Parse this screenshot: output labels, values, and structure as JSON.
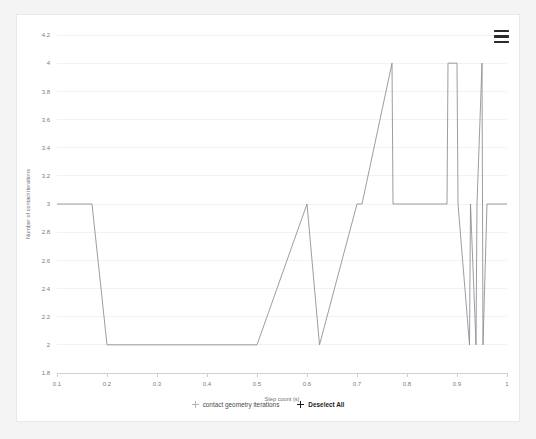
{
  "card": {
    "background": "#ffffff",
    "border_color": "#e9e9e9"
  },
  "menu": {
    "icon": "hamburger-menu-icon",
    "label": "Chart context menu"
  },
  "legend": {
    "entries": [
      {
        "label": "contact geometry iterations",
        "marker": "plus-marker",
        "color": "#b2b2b8",
        "state": "inactive"
      },
      {
        "label": "Deselect All",
        "marker": "plus-marker",
        "color": "#1b1b1b",
        "state": "active"
      }
    ]
  },
  "chart_data": {
    "type": "line",
    "title": "",
    "subtitle": "",
    "xlabel": "Step count (s)",
    "ylabel": "Number of contact iterations",
    "xlim": [
      0.1,
      1.0
    ],
    "ylim": [
      1.8,
      4.2
    ],
    "grid": true,
    "legend_position": "bottom",
    "line_color": "#8a8a92",
    "xticks": [
      "0.1",
      "0.2",
      "0.3",
      "0.4",
      "0.5",
      "0.6",
      "0.7",
      "0.8",
      "0.9",
      "1"
    ],
    "xtick_values": [
      0.1,
      0.2,
      0.3,
      0.4,
      0.5,
      0.6,
      0.7,
      0.8,
      0.9,
      1.0
    ],
    "yticks": [
      "1.8",
      "2",
      "2.2",
      "2.4",
      "2.6",
      "2.8",
      "3",
      "3.2",
      "3.4",
      "3.6",
      "3.8",
      "4",
      "4.2"
    ],
    "ytick_values": [
      1.8,
      2.0,
      2.2,
      2.4,
      2.6,
      2.8,
      3.0,
      3.2,
      3.4,
      3.6,
      3.8,
      4.0,
      4.2
    ],
    "series": [
      {
        "name": "contact geometry iterations",
        "x": [
          0.1,
          0.17,
          0.2,
          0.5,
          0.6,
          0.625,
          0.7,
          0.71,
          0.77,
          0.772,
          0.88,
          0.882,
          0.9,
          0.902,
          0.925,
          0.927,
          0.938,
          0.94,
          0.95,
          0.952,
          0.96,
          1.0
        ],
        "values": [
          3,
          3,
          2,
          2,
          3,
          2,
          3,
          3,
          4,
          3,
          3,
          4,
          4,
          3,
          2,
          3,
          2,
          3,
          4,
          2,
          3,
          3
        ]
      }
    ]
  }
}
